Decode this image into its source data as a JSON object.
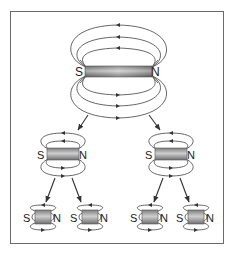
{
  "diagram": {
    "colors": {
      "frame": "#6b6b6b",
      "field_line": "#555555",
      "magnet_fill_dark": "#8a8a8a",
      "magnet_fill_light": "#d0d0d0",
      "arrow": "#333333"
    },
    "magnets": [
      {
        "id": "large",
        "level": 0,
        "south_label": "S",
        "north_label": "N"
      },
      {
        "id": "medium-left",
        "level": 1,
        "south_label": "S",
        "north_label": "N"
      },
      {
        "id": "medium-right",
        "level": 1,
        "south_label": "S",
        "north_label": "N"
      },
      {
        "id": "small-1",
        "level": 2,
        "south_label": "S",
        "north_label": "N"
      },
      {
        "id": "small-2",
        "level": 2,
        "south_label": "S",
        "north_label": "N"
      },
      {
        "id": "small-3",
        "level": 2,
        "south_label": "S",
        "north_label": "N"
      },
      {
        "id": "small-4",
        "level": 2,
        "south_label": "S",
        "north_label": "N"
      }
    ]
  }
}
